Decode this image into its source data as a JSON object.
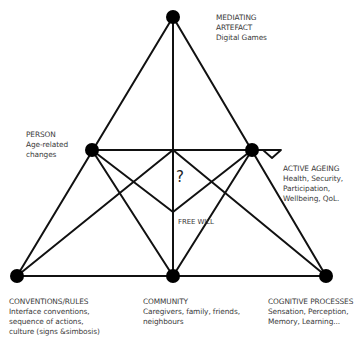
{
  "diagram": {
    "center_symbol": "?",
    "center_label": "FREE WILL",
    "nodes": [
      {
        "id": "top",
        "title": "MEDIATING",
        "lines": [
          "ARTEFACT",
          "Digital Games"
        ]
      },
      {
        "id": "person",
        "title": "PERSON",
        "lines": [
          "Age-related",
          "changes"
        ]
      },
      {
        "id": "active_ageing",
        "title": "ACTIVE AGEING",
        "lines": [
          "Health, Security,",
          "Participation,",
          "Wellbeing, QoL."
        ]
      },
      {
        "id": "conventions",
        "title": "CONVENTIONS/RULES",
        "lines": [
          "Interface conventions,",
          "sequence of actions,",
          "culture (signs &simbosis)"
        ]
      },
      {
        "id": "community",
        "title": "COMMUNITY",
        "lines": [
          "Caregivers, family, friends,",
          "neighbours"
        ]
      },
      {
        "id": "cognitive",
        "title": "COGNITIVE PROCESSES",
        "lines": [
          "Sensation, Perception,",
          "Memory, Learning..."
        ]
      }
    ],
    "colors": {
      "line": "#111111",
      "node": "#000000",
      "text": "#3a3a3a"
    }
  }
}
